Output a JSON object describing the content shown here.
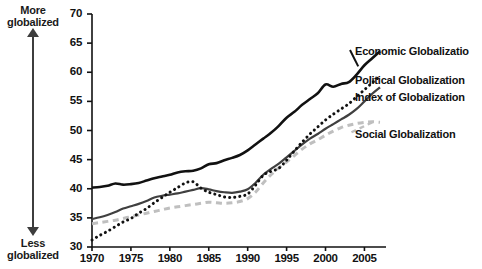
{
  "figure": {
    "title_fragment": "",
    "background": "#ffffff"
  },
  "annotations": {
    "top_label_line1": "More",
    "top_label_line2": "globalized",
    "bottom_label_line1": "Less",
    "bottom_label_line2": "globalized",
    "up_arrow_icon": "arrow-up-icon",
    "down_arrow_icon": "arrow-down-icon"
  },
  "chart_data": {
    "type": "line",
    "title": "",
    "xlabel": "",
    "ylabel": "",
    "xlim": [
      1970,
      2007
    ],
    "ylim": [
      30,
      70
    ],
    "grid": false,
    "legend_position": "right-inline",
    "xticks": [
      "1970",
      "1975",
      "1980",
      "1985",
      "1990",
      "1995",
      "2000",
      "2005"
    ],
    "xtick_values": [
      1970,
      1975,
      1980,
      1985,
      1990,
      1995,
      2000,
      2005
    ],
    "yticks": [
      "30",
      "35",
      "40",
      "45",
      "50",
      "55",
      "60",
      "65",
      "70"
    ],
    "ytick_values": [
      30,
      35,
      40,
      45,
      50,
      55,
      60,
      65,
      70
    ],
    "x": [
      1970,
      1971,
      1972,
      1973,
      1974,
      1975,
      1976,
      1977,
      1978,
      1979,
      1980,
      1981,
      1982,
      1983,
      1984,
      1985,
      1986,
      1987,
      1988,
      1989,
      1990,
      1991,
      1992,
      1993,
      1994,
      1995,
      1996,
      1997,
      1998,
      1999,
      2000,
      2001,
      2002,
      2003,
      2004,
      2005,
      2006,
      2007
    ],
    "series": [
      {
        "name": "Economic Globalization",
        "color": "#111111",
        "style": "solid",
        "width": 2.6,
        "label_clipped": "Economic Globalizatio",
        "values": [
          40.2,
          40.3,
          40.5,
          40.9,
          40.7,
          40.8,
          41.0,
          41.4,
          41.8,
          42.1,
          42.4,
          42.8,
          43.0,
          43.1,
          43.5,
          44.2,
          44.4,
          44.9,
          45.3,
          45.8,
          46.6,
          47.6,
          48.6,
          49.6,
          50.8,
          52.2,
          53.2,
          54.4,
          55.4,
          56.4,
          57.9,
          57.5,
          58.0,
          58.3,
          59.6,
          61.2,
          62.4,
          63.6
        ]
      },
      {
        "name": "Political Globalization",
        "color": "#111111",
        "style": "dotted",
        "width": 3.0,
        "values": [
          31.2,
          32.0,
          32.7,
          33.5,
          34.3,
          34.9,
          35.8,
          36.6,
          37.6,
          38.5,
          39.4,
          40.2,
          41.0,
          41.2,
          40.1,
          39.4,
          39.0,
          38.6,
          38.5,
          38.7,
          39.1,
          40.6,
          42.3,
          43.0,
          43.5,
          44.9,
          46.5,
          48.0,
          49.4,
          50.6,
          51.8,
          52.8,
          53.7,
          54.6,
          55.8,
          57.0,
          58.2,
          59.3
        ]
      },
      {
        "name": "Index of Globalization",
        "color": "#404040",
        "style": "solid",
        "width": 2.2,
        "values": [
          34.8,
          35.1,
          35.5,
          36.0,
          36.6,
          37.0,
          37.4,
          37.9,
          38.5,
          38.8,
          39.0,
          39.2,
          39.5,
          39.8,
          40.1,
          39.9,
          39.6,
          39.4,
          39.3,
          39.5,
          39.9,
          41.0,
          42.4,
          43.4,
          44.3,
          45.4,
          46.5,
          47.6,
          48.6,
          49.4,
          50.3,
          51.1,
          51.9,
          52.7,
          53.7,
          55.0,
          56.3,
          57.4
        ]
      },
      {
        "name": "Social Globalization",
        "color": "#bfbfbf",
        "style": "dashed",
        "width": 3.0,
        "values": [
          34.0,
          34.2,
          34.4,
          34.6,
          34.9,
          35.2,
          35.5,
          35.8,
          36.1,
          36.4,
          36.7,
          36.9,
          37.1,
          37.3,
          37.5,
          37.7,
          37.6,
          37.5,
          37.6,
          37.8,
          38.3,
          39.4,
          41.0,
          42.4,
          43.6,
          44.6,
          45.7,
          46.8,
          47.7,
          48.4,
          49.2,
          49.9,
          50.5,
          50.9,
          51.2,
          51.4,
          51.5,
          51.4
        ]
      }
    ]
  }
}
